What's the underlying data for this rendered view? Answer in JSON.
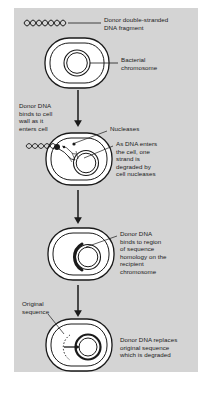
{
  "figure": {
    "background_color": "#d4d4d4",
    "page_color": "#ffffff",
    "ink_color": "#1a1a1a",
    "type": "biology-process-diagram"
  },
  "labels": {
    "donor_fragment": "Donor double-stranded\nDNA fragment",
    "bacterial_chromosome": "Bacterial\nchromosome",
    "binds_cell_wall": "Donor DNA\nbinds to cell\nwall as it\nenters cell",
    "nucleases": "Nucleases",
    "strand_degraded": "As DNA enters\nthe cell, one\nstrand is\ndegraded by\ncell nucleases",
    "homology_binding": "Donor DNA\nbinds to region\nof sequence\nhomology on the\nrecipient\nchromosome",
    "original_sequence": "Original\nsequence",
    "replacement": "Donor DNA replaces\noriginal sequence\nwhich is degraded"
  },
  "steps": [
    {
      "index": 1,
      "name": "donor-dna-and-recipient-cell",
      "elements": [
        "donor double-stranded DNA squiggle",
        "bacterial cell",
        "bacterial chromosome"
      ]
    },
    {
      "index": 2,
      "name": "dna-binds-and-enters-cell",
      "elements": [
        "DNA squiggle at cell wall",
        "entry point dot",
        "nuclease dots",
        "single strand being degraded"
      ]
    },
    {
      "index": 3,
      "name": "donor-dna-pairs-with-homologous-region",
      "elements": [
        "thick donor strand arc alongside chromosome"
      ]
    },
    {
      "index": 4,
      "name": "donor-dna-replaces-original-sequence",
      "elements": [
        "dotted original sequence arc",
        "replacement arrow",
        "recombined chromosome"
      ]
    }
  ],
  "arrows": {
    "flow_1_2": "downward process arrow",
    "flow_2_3": "downward process arrow",
    "flow_3_4": "downward process arrow"
  }
}
